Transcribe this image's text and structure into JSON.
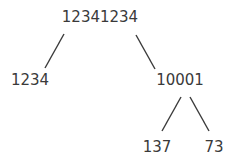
{
  "tree": {
    "root": {
      "label": "12341234"
    },
    "left": {
      "label": "1234"
    },
    "right": {
      "label": "10001"
    },
    "right_left": {
      "label": "137"
    },
    "right_right": {
      "label": "73"
    }
  }
}
